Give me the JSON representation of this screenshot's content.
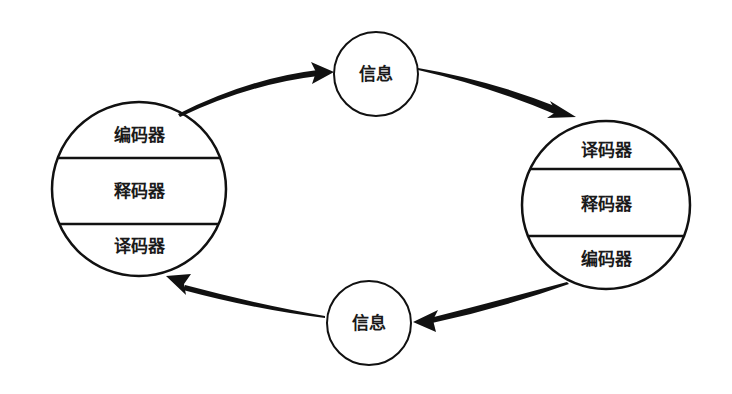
{
  "diagram": {
    "type": "communication-cycle",
    "left_party": {
      "sections": [
        "编码器",
        "释码器",
        "译码器"
      ]
    },
    "right_party": {
      "sections": [
        "译码器",
        "释码器",
        "编码器"
      ]
    },
    "top_message": {
      "label": "信息"
    },
    "bottom_message": {
      "label": "信息"
    },
    "colors": {
      "stroke": "#111111",
      "background": "#ffffff",
      "text": "#1a1a1a"
    }
  }
}
